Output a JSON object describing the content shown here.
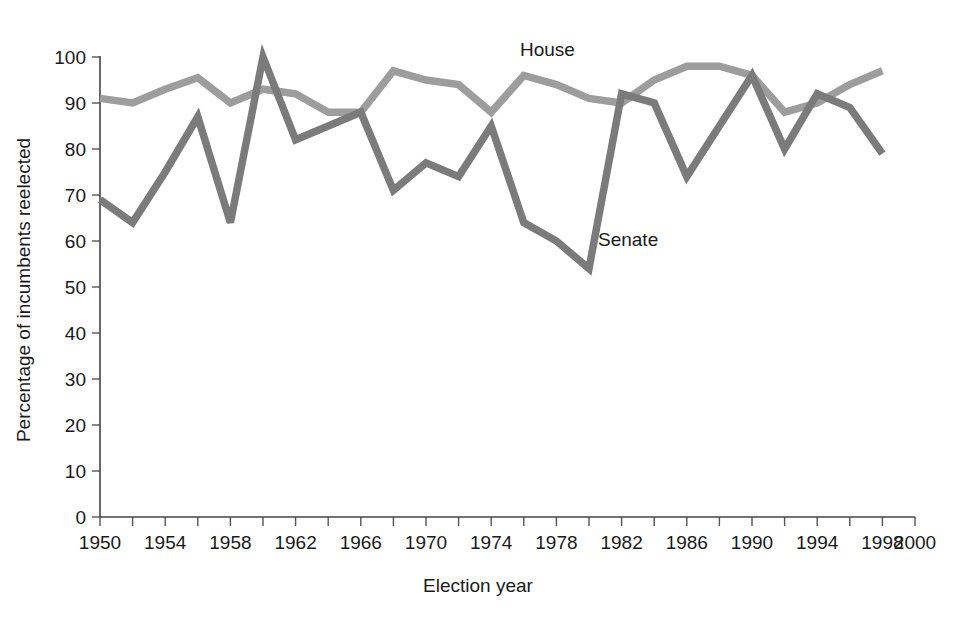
{
  "chart_data": {
    "type": "line",
    "title": "",
    "xlabel": "Election year",
    "ylabel": "Percentage of incumbents reelected",
    "xlim": [
      1950,
      2000
    ],
    "ylim": [
      0,
      100
    ],
    "grid": false,
    "legend_position": "inline-annotation",
    "x_tick_labels": [
      "1950",
      "1954",
      "1958",
      "1962",
      "1966",
      "1970",
      "1974",
      "1978",
      "1982",
      "1986",
      "1990",
      "1994",
      "1998",
      "2000"
    ],
    "x_tick_values": [
      1950,
      1954,
      1958,
      1962,
      1966,
      1970,
      1974,
      1978,
      1982,
      1986,
      1990,
      1994,
      1998,
      2000
    ],
    "x_minor_ticks": [
      1950,
      1952,
      1954,
      1956,
      1958,
      1960,
      1962,
      1964,
      1966,
      1968,
      1970,
      1972,
      1974,
      1976,
      1978,
      1980,
      1982,
      1984,
      1986,
      1988,
      1990,
      1992,
      1994,
      1996,
      1998,
      2000
    ],
    "y_tick_labels": [
      "0",
      "10",
      "20",
      "30",
      "40",
      "50",
      "60",
      "70",
      "80",
      "90",
      "100"
    ],
    "y_tick_values": [
      0,
      10,
      20,
      30,
      40,
      50,
      60,
      70,
      80,
      90,
      100
    ],
    "x": [
      1950,
      1952,
      1954,
      1956,
      1958,
      1960,
      1962,
      1964,
      1966,
      1968,
      1970,
      1972,
      1974,
      1976,
      1978,
      1980,
      1982,
      1984,
      1986,
      1988,
      1990,
      1992,
      1994,
      1996,
      1998
    ],
    "series": [
      {
        "name": "House",
        "color": "#9d9d9d",
        "label_text": "House",
        "values": [
          91,
          90,
          93,
          95.5,
          90,
          93,
          92,
          88,
          88,
          97,
          95,
          94,
          88,
          96,
          94,
          91,
          90,
          95,
          98,
          98,
          96,
          88,
          90,
          94,
          97
        ]
      },
      {
        "name": "Senate",
        "color": "#7b7b7b",
        "label_text": "Senate",
        "values": [
          69,
          64,
          75,
          87,
          64,
          100,
          82,
          85,
          88,
          71,
          77,
          74,
          85,
          64,
          60,
          54,
          92,
          90,
          74,
          85,
          96,
          80,
          92,
          89,
          79
        ]
      }
    ]
  },
  "annotations": {
    "house_label": "House",
    "senate_label": "Senate"
  }
}
